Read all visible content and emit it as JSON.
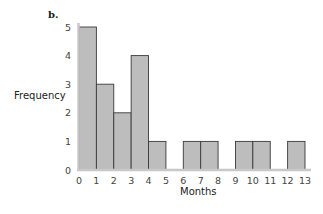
{
  "chart_data": {
    "type": "bar",
    "subtype": "histogram",
    "panel_label": "b.",
    "title": "",
    "xlabel": "Months",
    "ylabel": "Frequency",
    "bin_edges": [
      0,
      1,
      2,
      3,
      4,
      5,
      6,
      7,
      8,
      9,
      10,
      11,
      12,
      13
    ],
    "categories": [
      "0-1",
      "1-2",
      "2-3",
      "3-4",
      "4-5",
      "5-6",
      "6-7",
      "7-8",
      "8-9",
      "9-10",
      "10-11",
      "11-12",
      "12-13"
    ],
    "values": [
      5,
      3,
      2,
      4,
      1,
      0,
      1,
      1,
      0,
      1,
      1,
      0,
      1
    ],
    "x_ticks": [
      "0",
      "1",
      "2",
      "3",
      "4",
      "5",
      "6",
      "7",
      "8",
      "9",
      "10",
      "11",
      "12",
      "13"
    ],
    "y_ticks": [
      "0",
      "1",
      "2",
      "3",
      "4",
      "5"
    ],
    "xlim": [
      0,
      13
    ],
    "ylim": [
      0,
      5
    ],
    "grid": false,
    "legend": null,
    "colors": {
      "bar_fill": "#bdbdbd",
      "bar_edge": "#3a3a3a",
      "axis": "#c8c8c8",
      "text": "#444444"
    }
  }
}
